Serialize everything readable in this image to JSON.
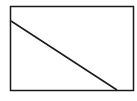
{
  "diagram": {
    "shape": "rectangle-with-diagonal",
    "stroke_color": "#1a1a1a",
    "background": "#ffffff",
    "rect": {
      "x": 10.5,
      "y": 6.5,
      "width": 123,
      "height": 84
    },
    "line": {
      "x1": 11,
      "y1": 21,
      "x2": 117,
      "y2": 90
    }
  }
}
